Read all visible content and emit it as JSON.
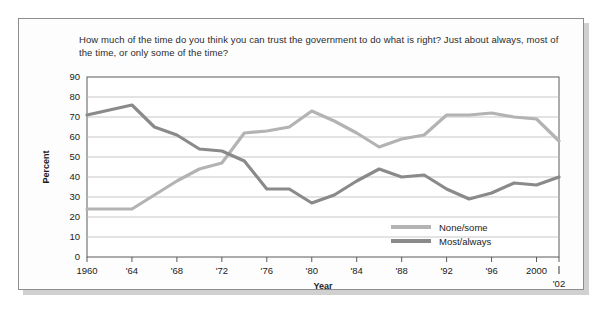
{
  "question": "How much of the time do you think you can trust the government to do what is right? Just about always, most of the time, or only some of the time?",
  "axes": {
    "ylabel": "Percent",
    "xlabel": "Year",
    "y_ticks": [
      "0",
      "10",
      "20",
      "30",
      "40",
      "50",
      "60",
      "70",
      "80",
      "90"
    ],
    "x_ticks": [
      "1960",
      "'64",
      "'68",
      "'72",
      "'76",
      "'80",
      "'84",
      "'88",
      "'92",
      "'96",
      "2000"
    ],
    "x_end_tick": "'02"
  },
  "legend": {
    "position": "inside-bottom-right",
    "entries": [
      {
        "label": "None/some",
        "color": "#b3b3b3"
      },
      {
        "label": "Most/always",
        "color": "#8a8a8a"
      }
    ]
  },
  "chart_data": {
    "type": "line",
    "title": "How much of the time do you think you can trust the government to do what is right? Just about always, most of the time, or only some of the time?",
    "xlabel": "Year",
    "ylabel": "Percent",
    "xlim": [
      1960,
      2002
    ],
    "ylim": [
      0,
      90
    ],
    "grid": true,
    "x": [
      1960,
      1964,
      1966,
      1968,
      1970,
      1972,
      1974,
      1976,
      1978,
      1980,
      1982,
      1984,
      1986,
      1988,
      1990,
      1992,
      1994,
      1996,
      1998,
      2000,
      2002
    ],
    "series": [
      {
        "name": "None/some",
        "color": "#b3b3b3",
        "values": [
          24,
          24,
          31,
          38,
          44,
          47,
          62,
          63,
          65,
          73,
          68,
          62,
          55,
          59,
          61,
          71,
          71,
          72,
          70,
          69,
          58
        ]
      },
      {
        "name": "Most/always",
        "color": "#8a8a8a",
        "values": [
          71,
          76,
          65,
          61,
          54,
          53,
          48,
          34,
          34,
          27,
          31,
          38,
          44,
          40,
          41,
          34,
          29,
          32,
          37,
          36,
          40
        ]
      }
    ]
  }
}
